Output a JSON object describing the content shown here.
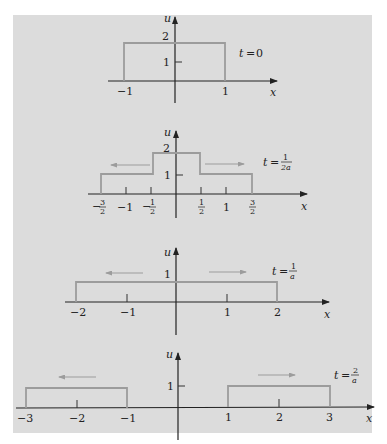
{
  "figure": {
    "colors": {
      "background": "#dcdcdc",
      "wave": "#9c9c9c",
      "axis": "#222222"
    },
    "panels": [
      {
        "time_label": {
          "t": "t",
          "eq": "=",
          "value": "0"
        },
        "y_axis_label": "u",
        "x_axis_label": "x",
        "y_ticks": [
          "1",
          "2"
        ],
        "x_ticks": [
          "−1",
          "1"
        ],
        "profile": [
          [
            -1,
            0
          ],
          [
            -1,
            2
          ],
          [
            1,
            2
          ],
          [
            1,
            0
          ]
        ],
        "arrows": []
      },
      {
        "time_label": {
          "t": "t",
          "eq": "=",
          "num": "1",
          "den": "2a"
        },
        "y_axis_label": "u",
        "x_axis_label": "x",
        "y_ticks": [
          "1",
          "2"
        ],
        "x_ticks": [
          {
            "sign": "−",
            "num": "3",
            "den": "2"
          },
          {
            "text": "−1"
          },
          {
            "sign": "−",
            "num": "1",
            "den": "2"
          },
          {
            "num": "1",
            "den": "2"
          },
          {
            "text": "1"
          },
          {
            "num": "3",
            "den": "2"
          }
        ],
        "profile": [
          [
            -1.5,
            0
          ],
          [
            -1.5,
            1
          ],
          [
            -0.5,
            1
          ],
          [
            -0.5,
            2
          ],
          [
            0.5,
            2
          ],
          [
            0.5,
            1
          ],
          [
            1.5,
            1
          ],
          [
            1.5,
            0
          ]
        ],
        "arrows": [
          "left",
          "right"
        ]
      },
      {
        "time_label": {
          "t": "t",
          "eq": "=",
          "num": "1",
          "den": "a"
        },
        "y_axis_label": "u",
        "x_axis_label": "x",
        "y_ticks": [
          "1"
        ],
        "x_ticks": [
          "−2",
          "−1",
          "1",
          "2"
        ],
        "profile": [
          [
            -2,
            0
          ],
          [
            -2,
            1
          ],
          [
            2,
            1
          ],
          [
            2,
            0
          ]
        ],
        "arrows": [
          "left",
          "right"
        ]
      },
      {
        "time_label": {
          "t": "t",
          "eq": "=",
          "num": "2",
          "den": "a"
        },
        "y_axis_label": "u",
        "x_axis_label": "x",
        "y_ticks": [
          "1"
        ],
        "x_ticks": [
          "−3",
          "−2",
          "−1",
          "1",
          "2",
          "3"
        ],
        "profile_left": [
          [
            -3,
            0
          ],
          [
            -3,
            1
          ],
          [
            -1,
            1
          ],
          [
            -1,
            0
          ]
        ],
        "profile_right": [
          [
            1,
            0
          ],
          [
            1,
            1
          ],
          [
            3,
            1
          ],
          [
            3,
            0
          ]
        ],
        "arrows": [
          "left",
          "right"
        ]
      }
    ]
  }
}
